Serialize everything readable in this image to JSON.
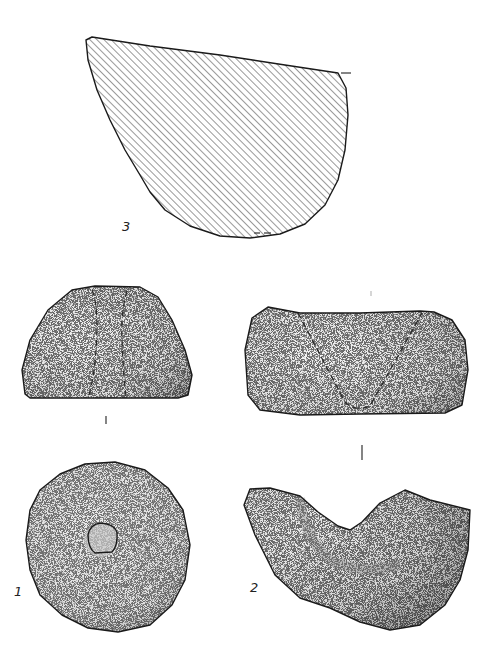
{
  "plate": {
    "type": "archaeological artifact illustration",
    "background": "#ffffff",
    "ink_color": "#1a1a1a"
  },
  "figures": [
    {
      "id": "fig-1",
      "label": "1",
      "description": "perforated stone disc (top view) and side profile"
    },
    {
      "id": "fig-2",
      "label": "2",
      "description": "saddle-shaped grooved stone (top view) and side view with V-groove"
    },
    {
      "id": "fig-3",
      "label": "3",
      "description": "hatched cross-section of stone fragment"
    }
  ]
}
